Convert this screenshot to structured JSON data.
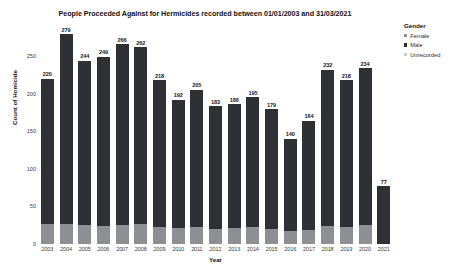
{
  "chart_data": {
    "type": "bar",
    "subtype": "stacked",
    "title": "People Proceeded Against for Hermicides recorded between 01/01/2003 and 31/03/2021",
    "xlabel": "Year",
    "ylabel": "Count of Homicide",
    "ylim": [
      0,
      290
    ],
    "yticks": [
      0,
      50,
      100,
      150,
      200,
      250
    ],
    "ytick_labels": [
      "0",
      "50",
      "100",
      "150",
      "200",
      "250"
    ],
    "grid": false,
    "legend_position": "right",
    "legend_title": "Gender",
    "categories": [
      "2003",
      "2004",
      "2005",
      "2006",
      "2007",
      "2008",
      "2009",
      "2010",
      "2011",
      "2012",
      "2013",
      "2014",
      "2015",
      "2016",
      "2017",
      "2018",
      "2019",
      "2020",
      "2021"
    ],
    "totals": [
      220,
      279,
      244,
      249,
      266,
      262,
      218,
      192,
      205,
      183,
      186,
      195,
      179,
      140,
      164,
      232,
      218,
      234,
      77
    ],
    "total_labels": [
      "220",
      "279",
      "244",
      "249",
      "266",
      "262",
      "218",
      "192",
      "205",
      "183",
      "186",
      "195",
      "179",
      "140",
      "164",
      "232",
      "218",
      "234",
      "77"
    ],
    "series": [
      {
        "name": "Female",
        "color": "#8d8f92",
        "values": [
          27,
          26,
          25,
          24,
          25,
          26,
          23,
          21,
          22,
          20,
          21,
          23,
          20,
          17,
          19,
          24,
          22,
          25,
          0
        ]
      },
      {
        "name": "Male",
        "color": "#2f3033",
        "values": [
          193,
          253,
          219,
          225,
          241,
          236,
          195,
          171,
          183,
          163,
          165,
          172,
          159,
          123,
          145,
          208,
          196,
          209,
          77
        ]
      },
      {
        "name": "Unrecorded",
        "color": "#c8cacc",
        "values": [
          0,
          0,
          0,
          0,
          0,
          0,
          0,
          0,
          0,
          0,
          0,
          0,
          0,
          0,
          0,
          0,
          0,
          0,
          0
        ]
      }
    ]
  },
  "legend": {
    "title": "Gender",
    "entries": [
      {
        "label": "Female",
        "color": "#8d8f92"
      },
      {
        "label": "Male",
        "color": "#2f3033"
      },
      {
        "label": "Unrecorded",
        "color": "#c8cacc"
      }
    ]
  }
}
